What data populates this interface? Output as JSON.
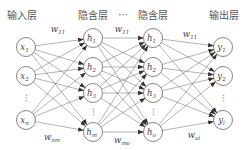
{
  "diagram": {
    "type": "fully-connected neural network",
    "headers": {
      "input": "输入层",
      "hidden1": "隐含层",
      "ellipsis": "···",
      "hidden2": "隐含层",
      "output": "输出层"
    },
    "layers": [
      {
        "name": "input",
        "nodes": [
          {
            "base": "x",
            "sub": "1"
          },
          {
            "base": "x",
            "sub": "2"
          },
          {
            "ellipsis": true
          },
          {
            "base": "x",
            "sub": "n"
          }
        ]
      },
      {
        "name": "hidden1",
        "nodes": [
          {
            "base": "h",
            "sub": "1"
          },
          {
            "base": "h",
            "sub": "2"
          },
          {
            "base": "h",
            "sub": "3"
          },
          {
            "ellipsis": true
          },
          {
            "base": "h",
            "sub": "m"
          }
        ]
      },
      {
        "name": "hidden2",
        "nodes": [
          {
            "base": "h",
            "sub": "1"
          },
          {
            "base": "h",
            "sub": "2"
          },
          {
            "base": "h",
            "sub": "3"
          },
          {
            "ellipsis": true
          },
          {
            "base": "h",
            "sub": "o"
          }
        ]
      },
      {
        "name": "output",
        "nodes": [
          {
            "base": "y",
            "sub": "1"
          },
          {
            "base": "y",
            "sub": "2"
          },
          {
            "ellipsis": true
          },
          {
            "base": "y",
            "sub": "l"
          }
        ]
      }
    ],
    "weights": {
      "top_left": {
        "base": "w",
        "sub": "11"
      },
      "top_mid": {
        "base": "w",
        "sub": "11"
      },
      "top_right": {
        "base": "w",
        "sub": "11"
      },
      "bottom_left": {
        "base": "w",
        "sub": "nm"
      },
      "bottom_mid": {
        "base": "w",
        "sub": "mo"
      },
      "bottom_right": {
        "base": "w",
        "sub": "ol"
      }
    },
    "colors": {
      "stroke": "#555555",
      "text": "#444444",
      "background": "#ffffff"
    }
  }
}
